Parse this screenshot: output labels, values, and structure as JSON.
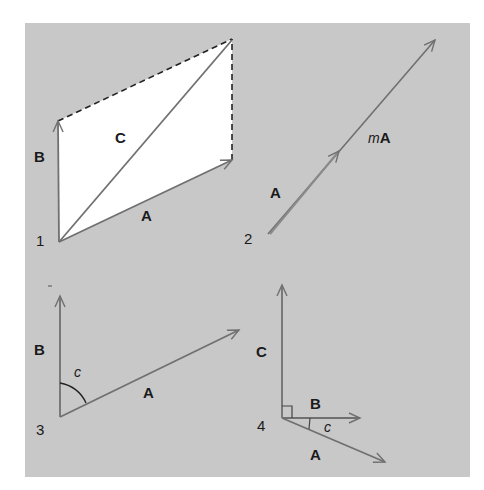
{
  "figure": {
    "background": "#c8c8c8",
    "vector_color": "#707070",
    "panels": [
      {
        "id": 1,
        "number": "1",
        "description": "Parallelogram addition: C = A + B",
        "labels": {
          "A": "A",
          "B": "B",
          "C": "C"
        }
      },
      {
        "id": 2,
        "number": "2",
        "description": "Scalar multiple of a vector",
        "labels": {
          "A": "A",
          "mA_italic": "m",
          "mA_bold": "A"
        }
      },
      {
        "id": 3,
        "number": "3",
        "description": "Angle c between vectors A and B",
        "labels": {
          "A": "A",
          "B": "B",
          "angle": "c"
        }
      },
      {
        "id": 4,
        "number": "4",
        "description": "Cross product C perpendicular to A and B",
        "labels": {
          "A": "A",
          "B": "B",
          "C": "C",
          "angle": "c"
        }
      }
    ]
  }
}
